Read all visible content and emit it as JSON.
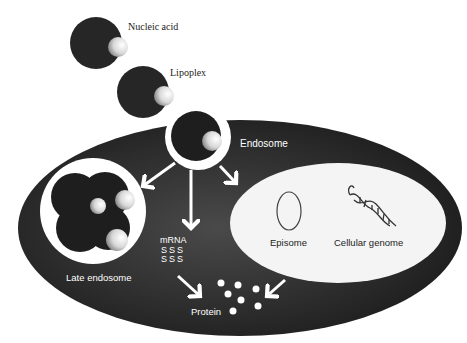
{
  "labels": {
    "nucleic_acid": "Nucleic acid",
    "lipoplex": "Lipoplex",
    "endosome": "Endosome",
    "late_endosome": "Late endosome",
    "mrna": "mRNA",
    "mrna_glyphs": "SSS",
    "episome": "Episome",
    "cellular_genome": "Cellular genome",
    "protein": "Protein"
  },
  "colors": {
    "cell": "#2a2a2a",
    "particle": "#262626",
    "nucleus": "#f4f4f4",
    "arrow": "#ffffff",
    "text_light": "#ffffff",
    "text_dark": "#222222"
  }
}
